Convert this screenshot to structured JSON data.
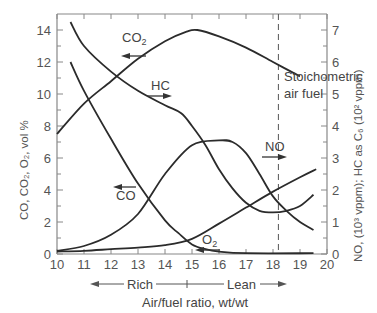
{
  "chart_data": {
    "type": "line",
    "title": "",
    "xlabel": "Air/fuel ratio, wt/wt",
    "ylabel_left": "CO, CO2, O2, vol %",
    "ylabel_right": "NO, (10^3 vppm); HC as C6 (10^2 vppm)",
    "xlim": [
      10,
      20
    ],
    "ylim_left": [
      0,
      14
    ],
    "ylim_right": [
      0,
      7
    ],
    "x_ticks": [
      "10",
      "11",
      "12",
      "13",
      "14",
      "15",
      "16",
      "17",
      "18",
      "19",
      "20"
    ],
    "y_ticks_left": [
      "0",
      "2",
      "4",
      "6",
      "8",
      "10",
      "12",
      "14"
    ],
    "y_ticks_right": [
      "0",
      "1",
      "2",
      "3",
      "4",
      "5",
      "6",
      "7"
    ],
    "grid": false,
    "annotations": {
      "stoichiometric_line_x": 14.8,
      "stoichiometric_label_line1": "Stoichometric",
      "stoichiometric_label_line2": "air fuel",
      "rich_label": "Rich",
      "lean_label": "Lean"
    },
    "series": [
      {
        "name": "CO2",
        "axis": "left",
        "arrow": "left",
        "x": [
          10,
          11,
          12,
          13,
          14,
          14.8,
          15.2,
          16,
          17,
          18,
          19
        ],
        "y": [
          7.5,
          9.4,
          10.8,
          12.2,
          13.3,
          13.9,
          14.0,
          13.6,
          12.9,
          12.0,
          11.1
        ]
      },
      {
        "name": "CO",
        "axis": "left",
        "arrow": "left",
        "x": [
          10.5,
          11,
          12,
          13,
          14,
          14.5,
          15,
          15.5,
          16,
          17,
          19.5
        ],
        "y": [
          12.0,
          10.2,
          7.2,
          4.4,
          2.1,
          1.3,
          0.6,
          0.3,
          0.15,
          0.05,
          0.05
        ]
      },
      {
        "name": "O2",
        "axis": "left",
        "arrow": "left",
        "x": [
          10,
          11,
          12,
          13,
          14,
          15,
          16,
          17,
          18,
          19,
          19.6
        ],
        "y": [
          0.15,
          0.2,
          0.3,
          0.4,
          0.55,
          0.95,
          1.9,
          2.9,
          3.9,
          4.8,
          5.3
        ]
      },
      {
        "name": "HC",
        "axis": "right",
        "arrow": "right",
        "x": [
          10.5,
          11,
          12,
          13,
          14,
          14.6,
          15,
          15.5,
          16,
          16.5,
          17,
          17.5,
          18,
          18.5,
          19,
          19.5
        ],
        "y": [
          7.25,
          6.5,
          5.7,
          5.1,
          4.65,
          4.4,
          4.0,
          3.4,
          2.65,
          2.05,
          1.6,
          1.35,
          1.3,
          1.35,
          1.5,
          1.85
        ]
      },
      {
        "name": "NO",
        "axis": "right",
        "arrow": "right",
        "x": [
          10,
          11,
          12,
          13,
          14,
          15,
          16,
          16.5,
          17,
          17.5,
          18,
          18.5,
          19,
          19.5
        ],
        "y": [
          0.1,
          0.25,
          0.6,
          1.25,
          2.5,
          3.4,
          3.55,
          3.5,
          3.15,
          2.5,
          1.8,
          1.35,
          1.0,
          0.75
        ]
      }
    ]
  },
  "labels": {
    "co2": "CO",
    "co2_sub": "2",
    "hc": "HC",
    "co": "CO",
    "o2": "O",
    "o2_sub": "2",
    "no": "NO",
    "stoich1": "Stoichometric",
    "stoich2": "air fuel",
    "rich": "Rich",
    "lean": "Lean",
    "xlabel": "Air/fuel ratio, wt/wt",
    "ylabel_left": "CO, CO₂, O₂, vol %",
    "ylabel_right": "NO, (10³ vppm); HC as C₆ (10² vppm)"
  },
  "colors": {
    "curve": "#2b2b2b",
    "axis": "#888888",
    "text": "#444444"
  }
}
